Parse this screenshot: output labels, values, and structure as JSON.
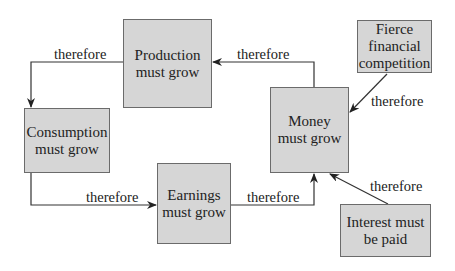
{
  "diagram": {
    "nodes": {
      "production": {
        "line1": "Production",
        "line2": "must grow"
      },
      "consumption": {
        "line1": "Consumption",
        "line2": "must grow"
      },
      "earnings": {
        "line1": "Earnings",
        "line2": "must grow"
      },
      "money": {
        "line1": "Money",
        "line2": "must grow"
      },
      "fierce": {
        "line1": "Fierce",
        "line2": "financial",
        "line3": "competition"
      },
      "interest": {
        "line1": "Interest must",
        "line2": "be paid"
      }
    },
    "edges": [
      {
        "from": "production",
        "to": "consumption",
        "label": "therefore"
      },
      {
        "from": "consumption",
        "to": "earnings",
        "label": "therefore"
      },
      {
        "from": "earnings",
        "to": "money",
        "label": "therefore"
      },
      {
        "from": "money",
        "to": "production",
        "label": "therefore"
      },
      {
        "from": "fierce",
        "to": "money",
        "label": "therefore"
      },
      {
        "from": "interest",
        "to": "money",
        "label": "therefore"
      }
    ],
    "colors": {
      "box_fill": "#d6d6d6",
      "box_border": "#6b6b6b",
      "line": "#333333",
      "background": "#ffffff"
    }
  }
}
